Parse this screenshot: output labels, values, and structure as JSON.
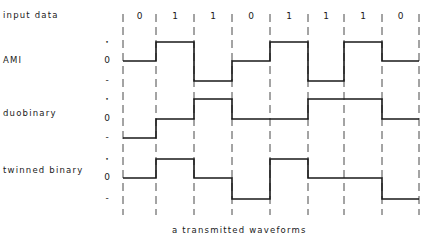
{
  "title": "input data",
  "caption": "a transmitted waveforms",
  "level_symbols": [
    "+",
    "0",
    "-"
  ],
  "bits": [
    "0",
    "1",
    "1",
    "0",
    "1",
    "1",
    "1",
    "0"
  ],
  "boundaries_px": [
    123,
    156,
    194,
    232,
    270,
    308,
    344,
    382,
    419
  ],
  "rows": [
    {
      "label": "AMI",
      "levels": [
        0,
        1,
        -1,
        0,
        1,
        -1,
        1,
        0
      ],
      "y_plus": 42,
      "y_zero": 61,
      "y_minus": 81
    },
    {
      "label": "duobinary",
      "levels": [
        -1,
        0,
        1,
        0,
        0,
        1,
        1,
        0
      ],
      "y_plus": 99,
      "y_zero": 119,
      "y_minus": 138
    },
    {
      "label": "twinned binary",
      "levels": [
        0,
        1,
        0,
        -1,
        1,
        0,
        0,
        -1
      ],
      "y_plus": 159,
      "y_zero": 178,
      "y_minus": 199
    }
  ],
  "colors": {
    "line": "#1a1a1a",
    "dash": "#333333",
    "background": "#ffffff"
  }
}
